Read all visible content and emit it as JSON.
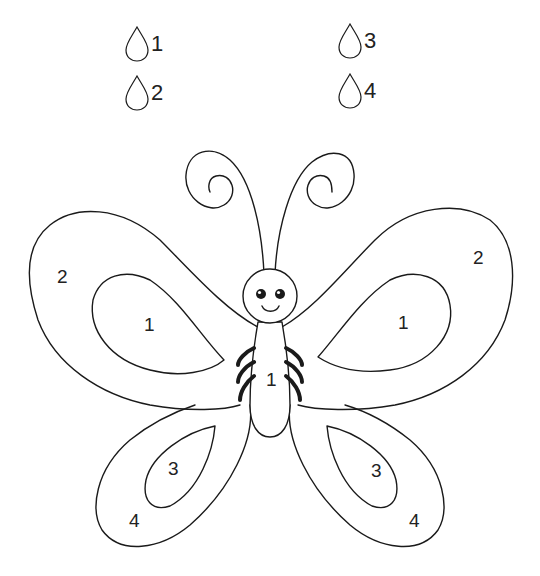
{
  "legend": [
    {
      "number": "1",
      "x": 124,
      "y": 26
    },
    {
      "number": "2",
      "x": 124,
      "y": 75
    },
    {
      "number": "3",
      "x": 337,
      "y": 23
    },
    {
      "number": "4",
      "x": 337,
      "y": 73
    }
  ],
  "labels": {
    "left_upper_outer": "2",
    "left_upper_inner": "1",
    "right_upper_outer": "2",
    "right_upper_inner": "1",
    "body": "1",
    "left_lower_inner": "3",
    "left_lower_outer": "4",
    "right_lower_inner": "3",
    "right_lower_outer": "4"
  },
  "colors": {
    "stroke": "#1a1a1a",
    "background": "#ffffff"
  }
}
